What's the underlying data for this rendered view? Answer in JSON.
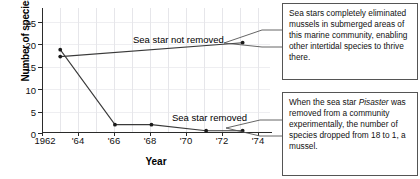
{
  "chart_data": {
    "type": "line",
    "title": "",
    "xlabel": "Year",
    "ylabel": "Number of species",
    "xlim": [
      1962,
      1974.5
    ],
    "ylim": [
      0,
      27
    ],
    "grid": true,
    "legend_position": "inline-annotation",
    "x_tick_labels": [
      "1962",
      "'64",
      "'66",
      "'68",
      "'70",
      "'72",
      "'74"
    ],
    "x_tick_values": [
      1962,
      1964,
      1966,
      1968,
      1970,
      1972,
      1974
    ],
    "y_tick_labels": [
      "0",
      "5",
      "10",
      "15",
      "20",
      "25"
    ],
    "y_tick_values": [
      0,
      5,
      10,
      15,
      20,
      25
    ],
    "series": [
      {
        "name": "Sea star not removed",
        "x": [
          1963,
          1973
        ],
        "values": [
          16.5,
          19.5
        ]
      },
      {
        "name": "Sea star removed",
        "x": [
          1963,
          1966,
          1968,
          1971,
          1973
        ],
        "values": [
          18,
          1.8,
          1.8,
          0.5,
          0.5
        ]
      }
    ],
    "annotations": [
      {
        "text": "Sea star not removed",
        "x": 1968.4,
        "y": 21.6
      },
      {
        "text": "Sea star removed",
        "x": 1970.5,
        "y": 3.4
      }
    ]
  },
  "axes": {
    "x_title": "Year",
    "y_title": "Number of species"
  },
  "series_labels": {
    "not_removed": "Sea star not removed",
    "removed": "Sea star removed"
  },
  "callouts": {
    "top": "Sea stars completely eliminated mussels in submerged areas of this marine community, enabling other intertidal species to thrive there.",
    "bottom_part1": "When the sea star ",
    "bottom_italic": "Pisaster",
    "bottom_part2": " was removed from a community experimentally, the number of species dropped from 18 to 1, a mussel."
  }
}
